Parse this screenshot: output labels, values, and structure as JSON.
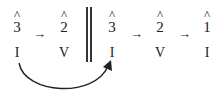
{
  "diagram": {
    "left_group": {
      "degrees": [
        {
          "hat": "^",
          "num": "3"
        },
        {
          "hat": "^",
          "num": "2"
        }
      ],
      "harmonies": [
        "I",
        "V"
      ],
      "arrows": [
        "→"
      ]
    },
    "divider": "double-barline",
    "right_group": {
      "degrees": [
        {
          "hat": "^",
          "num": "3"
        },
        {
          "hat": "^",
          "num": "2"
        },
        {
          "hat": "^",
          "num": "1"
        }
      ],
      "harmonies": [
        "I",
        "V",
        "I"
      ],
      "arrows": [
        "→",
        "→"
      ]
    },
    "connector": {
      "from": "left I",
      "to": "right I",
      "style": "curved-arrow"
    }
  }
}
